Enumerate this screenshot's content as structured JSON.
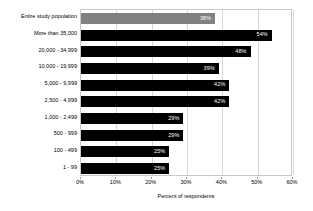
{
  "chart_data": {
    "type": "bar",
    "orientation": "horizontal",
    "title": "",
    "xlabel": "Percent of respondents",
    "ylabel": "",
    "xlim": [
      0,
      60
    ],
    "xtick_labels": [
      "0%",
      "10%",
      "20%",
      "30%",
      "40%",
      "50%",
      "60%"
    ],
    "xticks": [
      0,
      10,
      20,
      30,
      40,
      50,
      60
    ],
    "grid": "vertical",
    "legend": "none",
    "categories": [
      "Entire study population",
      "More than 35,000",
      "20,000 - 34,999",
      "10,000 - 19,999",
      "5,000 - 9,999",
      "2,500 - 4,999",
      "1,000 - 2,499",
      "500 - 999",
      "100 - 499",
      "1 - 99"
    ],
    "values": [
      38,
      54,
      48,
      39,
      42,
      42,
      29,
      29,
      25,
      25
    ],
    "value_labels": [
      "38%",
      "54%",
      "48%",
      "39%",
      "42%",
      "42%",
      "29%",
      "29%",
      "25%",
      "25%"
    ],
    "bar_colors": [
      "#808080",
      "#000000",
      "#000000",
      "#000000",
      "#000000",
      "#000000",
      "#000000",
      "#000000",
      "#000000",
      "#000000"
    ],
    "value_label_color": "#ffffff",
    "gridline_color": "#d6d6d6",
    "plot_border_color": "#c9c9c9",
    "background_color": "#ffffff"
  }
}
